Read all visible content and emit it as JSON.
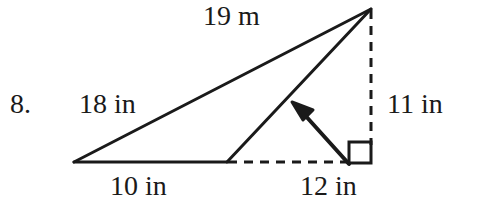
{
  "figure": {
    "kind": "geometry-triangle-diagram",
    "background_color": "#ffffff",
    "stroke_color": "#1a1a1a",
    "problem_number": "8.",
    "labels": {
      "top_side": "19 m",
      "left_side": "18 in",
      "right_side": "11 in",
      "base_left": "10 in",
      "base_right": "12 in"
    },
    "markers": {
      "right_angle": "right-angle-square",
      "pointer": "arrow-pointing-to-slant-side"
    },
    "geometry": {
      "apex": [
        371,
        9
      ],
      "left_vertex": [
        74,
        162
      ],
      "mid_vertex": [
        227,
        162
      ],
      "foot": [
        371,
        162
      ],
      "solid_edges": [
        "left_vertex-to-apex",
        "mid_vertex-to-apex",
        "left_vertex-to-mid_vertex"
      ],
      "dashed_edges": [
        "apex-to-foot",
        "mid_vertex-to-foot"
      ],
      "arrow": {
        "tail": [
          350,
          163
        ],
        "tip": [
          293,
          103
        ]
      },
      "right_angle_square": {
        "x": 349,
        "y": 142,
        "size": 22
      }
    }
  }
}
